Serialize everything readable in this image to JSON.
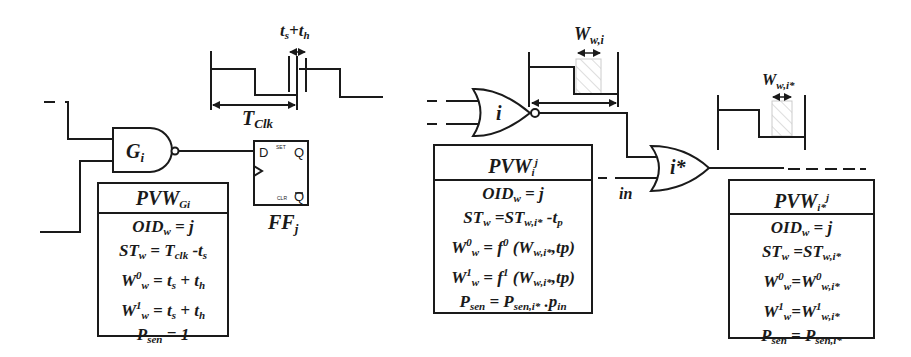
{
  "left": {
    "gate": {
      "label": "G",
      "sub": "i",
      "type": "NAND"
    },
    "flipflop": {
      "label": "FF",
      "sub": "j",
      "pins": {
        "d": "D",
        "set": "SET",
        "q": "Q",
        "clr": "CLR",
        "qbar": "Q"
      }
    },
    "waveform": {
      "period_label": "T",
      "period_sub": "Clk",
      "window_label": "t_s+t_h",
      "window_t1": "t",
      "window_s1": "s",
      "window_plus": "+",
      "window_t2": "t",
      "window_s2": "h"
    },
    "pvw": {
      "title": "PVW",
      "title_sub": "Gi",
      "lines": [
        {
          "text": "OID",
          "sub": "w",
          "rest": " = j"
        },
        {
          "text": "ST",
          "sub": "w",
          "rest": " = T",
          "sub2": "clk",
          "rest2": " -t",
          "sub3": "s"
        },
        {
          "text": "W",
          "sup": "0",
          "sub": "w",
          "rest": " = t",
          "sub2": "s",
          "rest2": " + t",
          "sub3": "h"
        },
        {
          "text": "W",
          "sup": "1",
          "sub": "w",
          "rest": " = t",
          "sub2": "s",
          "rest2": " + t",
          "sub3": "h"
        },
        {
          "text": "P",
          "sub": "sen",
          "rest": " = 1"
        }
      ]
    }
  },
  "middle": {
    "gate": {
      "label": "i",
      "type": "NOR"
    },
    "waveform": {
      "width_label": "W",
      "width_sub": "w,i"
    },
    "pvw": {
      "title": "PVW",
      "title_sub": "i",
      "title_sup": "j",
      "lines": [
        {
          "text": "OID",
          "sub": "w",
          "rest": " = j"
        },
        {
          "text": "ST",
          "sub": "w",
          "rest": " =ST",
          "sub2": "w,i*",
          "rest2": " -t",
          "sub3": "p"
        },
        {
          "text": "W",
          "sup": "0",
          "sub": "w",
          "rest": " = f",
          "sup2": "0",
          "rest2": " (W",
          "sub3": "w,i*",
          "rest3": ",tp)"
        },
        {
          "text": "W",
          "sup": "1",
          "sub": "w",
          "rest": " = f",
          "sup2": "1",
          "rest2": " (W",
          "sub3": "w,i*",
          "rest3": ",tp)"
        },
        {
          "text": "P",
          "sub": "sen",
          "rest": " = P",
          "sub2": "sen,i*",
          "rest2": " .p",
          "sub3": "in"
        }
      ]
    }
  },
  "right": {
    "gate": {
      "label": "i*",
      "type": "OR",
      "input_label": "in"
    },
    "waveform": {
      "width_label": "W",
      "width_sub": "w,i*"
    },
    "pvw": {
      "title": "PVW",
      "title_sub": "i*",
      "title_sup": "j",
      "lines": [
        {
          "text": "OID",
          "sub": "w",
          "rest": " = j"
        },
        {
          "text": "ST",
          "sub": "w",
          "rest": " =ST",
          "sub2": "w,i*"
        },
        {
          "text": "W",
          "sup": "0",
          "sub": "w",
          "rest": "=W",
          "sup2": "0",
          "sub2": "w,i*"
        },
        {
          "text": "W",
          "sup": "1",
          "sub": "w",
          "rest": "=W",
          "sup2": "1",
          "sub2": "w,i*"
        },
        {
          "text": "P",
          "sub": "sen",
          "rest": " = P",
          "sub2": "sen,i*"
        }
      ]
    }
  }
}
